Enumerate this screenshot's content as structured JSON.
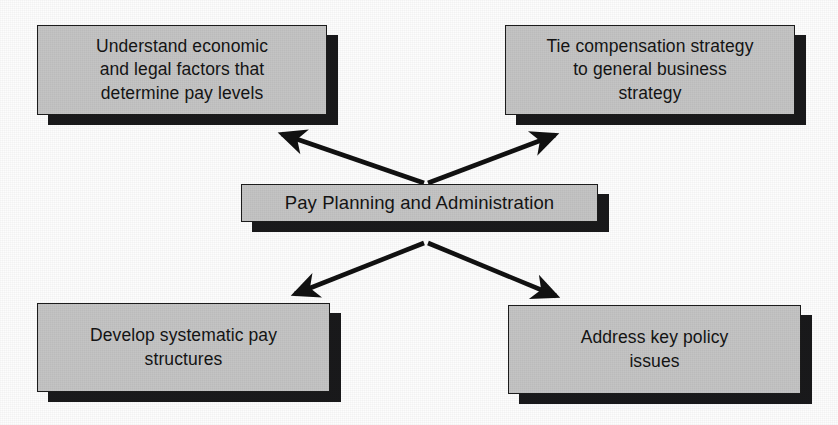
{
  "diagram": {
    "title": "Pay Planning and Administration",
    "center": {
      "id": "center",
      "label": "Pay Planning and Administration",
      "x": 241,
      "y": 184,
      "w": 357,
      "h": 38
    },
    "nodes": [
      {
        "id": "top-left",
        "label": "Understand economic\nand legal factors that\ndetermine pay levels",
        "x": 37,
        "y": 25,
        "w": 290,
        "h": 90
      },
      {
        "id": "top-right",
        "label": "Tie compensation strategy\nto general business\nstrategy",
        "x": 505,
        "y": 25,
        "w": 290,
        "h": 90
      },
      {
        "id": "bottom-left",
        "label": "Develop systematic pay\nstructures",
        "x": 37,
        "y": 303,
        "w": 293,
        "h": 89
      },
      {
        "id": "bottom-right",
        "label": "Address key policy\nissues",
        "x": 508,
        "y": 305,
        "w": 293,
        "h": 89
      }
    ],
    "connectors": [
      {
        "id": "center-to-top-left",
        "from": "center",
        "to": "top-left",
        "direction": "to-node"
      },
      {
        "id": "center-to-top-right",
        "from": "center",
        "to": "top-right",
        "direction": "to-node"
      },
      {
        "id": "center-to-bottom-left",
        "from": "center",
        "to": "bottom-left",
        "direction": "to-node"
      },
      {
        "id": "center-to-bottom-right",
        "from": "center",
        "to": "bottom-right",
        "direction": "to-node"
      }
    ],
    "colors": {
      "box_fill": "#c4c4c4",
      "box_border": "#1c1c1c",
      "shadow": "#19191b",
      "text": "#141414",
      "arrow": "#111111",
      "background": "#fdfdfd"
    }
  }
}
